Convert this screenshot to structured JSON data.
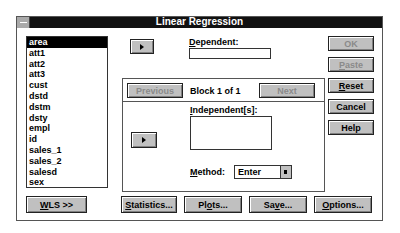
{
  "window": {
    "title": "Linear Regression"
  },
  "variables": [
    "area",
    "att1",
    "att2",
    "att3",
    "cust",
    "dstd",
    "dstm",
    "dsty",
    "empl",
    "id",
    "sales_1",
    "sales_2",
    "salesd",
    "sex"
  ],
  "selected_variable": "area",
  "dependent": {
    "label": "Dependent:",
    "value": ""
  },
  "block": {
    "previous": "Previous",
    "status": "Block 1 of 1",
    "next": "Next"
  },
  "independent": {
    "label": "Independent[s]:",
    "value": ""
  },
  "method": {
    "label": "Method:",
    "value": "Enter"
  },
  "side_buttons": {
    "ok": "OK",
    "paste": "Paste",
    "reset": "Reset",
    "cancel": "Cancel",
    "help": "Help"
  },
  "bottom_buttons": {
    "wls": "WLS >>",
    "statistics": "Statistics...",
    "plots": "Plots...",
    "save": "Save...",
    "options": "Options..."
  }
}
